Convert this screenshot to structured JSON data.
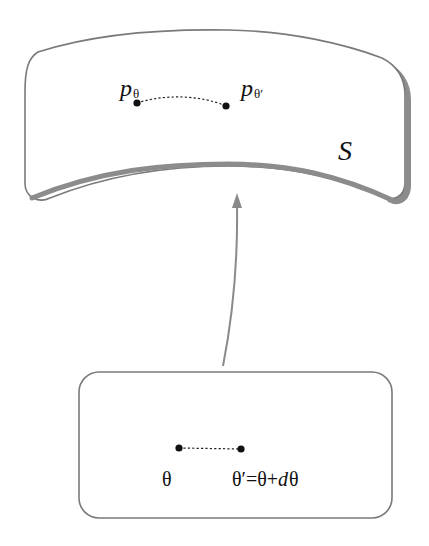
{
  "diagram": {
    "type": "mapping-diagram",
    "surface": {
      "label": "S",
      "points": [
        {
          "id": "p_theta",
          "label_main": "p",
          "label_sub": "θ"
        },
        {
          "id": "p_theta_prime",
          "label_main": "p",
          "label_sub": "θ′"
        }
      ],
      "connector": "dotted-curve"
    },
    "parameter_space": {
      "points": [
        {
          "id": "theta",
          "label": "θ"
        },
        {
          "id": "theta_prime",
          "label_parts": [
            "θ′=θ+",
            "d",
            "θ"
          ]
        }
      ],
      "connector": "dotted-line"
    },
    "arrow": {
      "from": "parameter_space",
      "to": "surface"
    },
    "colors": {
      "outline": "#7a7a7a",
      "shadow": "#8c8c8c",
      "arrow": "#8a8a8a",
      "points": "#111111",
      "background": "#ffffff"
    }
  }
}
